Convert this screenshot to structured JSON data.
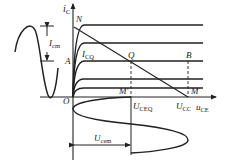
{
  "diagram": {
    "type": "BJT output characteristic with load line and waveforms",
    "colors": {
      "stroke": "#222222",
      "background": "#ffffff"
    },
    "axes": {
      "y_label": {
        "main": "i",
        "sub": "C"
      },
      "x_label": {
        "main": "u",
        "sub": "CE"
      },
      "origin_label": "O"
    },
    "points": {
      "N": "N",
      "A": "A",
      "Q": "Q",
      "B": "B",
      "M": "M",
      "M_prime": "M′"
    },
    "labels": {
      "icq": {
        "main": "I",
        "sub": "CQ"
      },
      "icm": {
        "main": "I",
        "sub": "cm"
      },
      "uceq": {
        "main": "U",
        "sub": "CEQ"
      },
      "ucc": {
        "main": "U",
        "sub": "CC"
      },
      "ucem": {
        "main": "U",
        "sub": "cem"
      }
    }
  }
}
